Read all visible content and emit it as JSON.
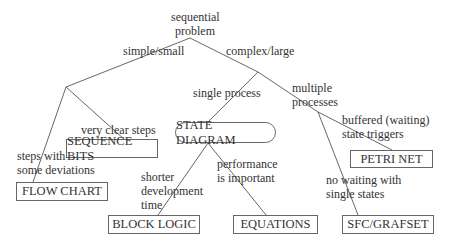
{
  "root": {
    "line1": "sequential",
    "line2": "problem"
  },
  "edges": {
    "simple_small": "simple/small",
    "complex_large": "complex/large",
    "very_clear_steps": "very clear steps",
    "steps_with_deviations": {
      "line1": "steps with",
      "line2": "some deviations"
    },
    "single_process": "single process",
    "multiple_processes": {
      "line1": "multiple",
      "line2": "processes"
    },
    "shorter_dev_time": {
      "line1": "shorter",
      "line2": "development",
      "line3": "time"
    },
    "performance": {
      "line1": "performance",
      "line2": "is important"
    },
    "buffered": {
      "line1": "buffered (waiting)",
      "line2": "state triggers"
    },
    "no_waiting": {
      "line1": "no waiting with",
      "line2": "single states"
    }
  },
  "nodes": {
    "sequence_bits": "SEQUENCE BITS",
    "flow_chart": "FLOW CHART",
    "state_diagram": "STATE DIAGRAM",
    "block_logic": "BLOCK LOGIC",
    "equations": "EQUATIONS",
    "petri_net": "PETRI NET",
    "sfc_grafset": "SFC/GRAFSET"
  }
}
